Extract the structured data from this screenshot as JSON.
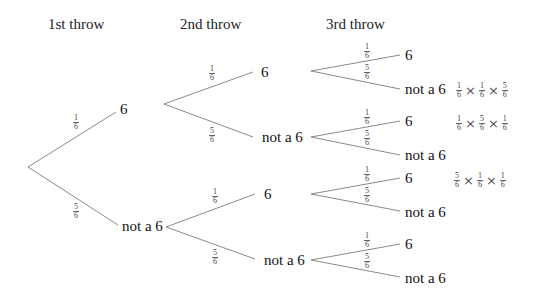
{
  "headers": {
    "first": "1st throw",
    "second": "2nd throw",
    "third": "3rd throw"
  },
  "outcomes": {
    "six": "6",
    "not_six": "not a 6"
  },
  "probabilities": {
    "six": {
      "num": "1",
      "den": "6"
    },
    "not_six": {
      "num": "5",
      "den": "6"
    }
  },
  "products": [
    {
      "terms": [
        {
          "num": "1",
          "den": "6"
        },
        {
          "num": "1",
          "den": "6"
        },
        {
          "num": "5",
          "den": "6"
        }
      ],
      "times": "×"
    },
    {
      "terms": [
        {
          "num": "1",
          "den": "6"
        },
        {
          "num": "5",
          "den": "6"
        },
        {
          "num": "1",
          "den": "6"
        }
      ],
      "times": "×"
    },
    {
      "terms": [
        {
          "num": "5",
          "den": "6"
        },
        {
          "num": "1",
          "den": "6"
        },
        {
          "num": "1",
          "den": "6"
        }
      ],
      "times": "×"
    }
  ],
  "colors": {
    "line": "#8a8a8a",
    "text": "#111111"
  }
}
